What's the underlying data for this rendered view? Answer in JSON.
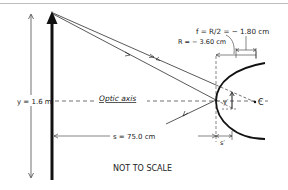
{
  "diagram": {
    "type": "convex-mirror-ray-diagram",
    "labels": {
      "focal": "f = R/2 = − 1.80 cm",
      "radius": "R = − 3.60 cm",
      "object_height": "y = 1.6 m",
      "optic_axis": "Optic axis",
      "object_distance": "s = 75.0 cm",
      "image_height": "y′",
      "image_distance": "s′",
      "center": "C",
      "note": "NOT TO SCALE"
    },
    "colors": {
      "ink": "#111111",
      "background": "#ffffff",
      "frame_line": "#bdbdbd"
    }
  }
}
